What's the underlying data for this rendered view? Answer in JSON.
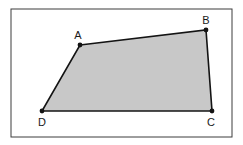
{
  "figure": {
    "kind": "geometry-diagram",
    "background_color": "#ffffff",
    "frame": {
      "x": 11,
      "y": 9,
      "width": 221,
      "height": 128,
      "stroke_color": "#3c3c3c",
      "stroke_width": 1,
      "fill_color": "#ffffff"
    },
    "polygon": {
      "name": "ABCD",
      "fill_color": "#c8c8c8",
      "stroke_color": "#141414",
      "stroke_width": 1.6,
      "points": "80,45 206,30 212,111 42,111"
    },
    "vertices": [
      {
        "id": "A",
        "label": "A",
        "x": 80,
        "y": 45,
        "label_x": 78,
        "label_y": 36
      },
      {
        "id": "B",
        "label": "B",
        "x": 206,
        "y": 30,
        "label_x": 206,
        "label_y": 21
      },
      {
        "id": "C",
        "label": "C",
        "x": 212,
        "y": 111,
        "label_x": 211,
        "label_y": 123
      },
      {
        "id": "D",
        "label": "D",
        "x": 42,
        "y": 111,
        "label_x": 42,
        "label_y": 123
      }
    ],
    "vertex_dot": {
      "radius": 2.4,
      "fill_color": "#141414"
    }
  }
}
